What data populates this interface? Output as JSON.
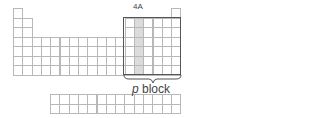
{
  "diagram": {
    "type": "periodic-table-outline",
    "highlighted_group_label": "4A",
    "block_label_italic": "p",
    "block_label_rest": " block",
    "colors": {
      "grid_line": "#b8b8b8",
      "shaded_column": "#dcdcdc",
      "p_block_outline": "#555555",
      "text": "#444444"
    },
    "main_table": {
      "columns": 18,
      "rows": 7
    },
    "f_block": {
      "columns": 14,
      "rows": 2
    },
    "highlighted_group_index": 14
  }
}
